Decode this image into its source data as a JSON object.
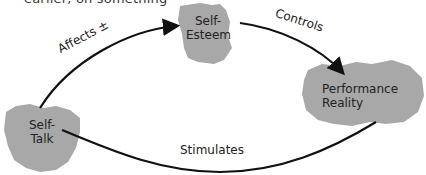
{
  "header": {
    "clipped_text": "earlier, on something"
  },
  "nodes": [
    {
      "id": "self-talk",
      "label_line1": "Self-",
      "label_line2": "Talk"
    },
    {
      "id": "self-esteem",
      "label_line1": "Self-",
      "label_line2": "Esteem"
    },
    {
      "id": "performance-reality",
      "label_line1": "Performance",
      "label_line2": "Reality"
    }
  ],
  "edges": [
    {
      "from": "self-talk",
      "to": "self-esteem",
      "label": "Affects ±"
    },
    {
      "from": "self-esteem",
      "to": "performance-reality",
      "label": "Controls"
    },
    {
      "from": "self-talk",
      "to": "performance-reality",
      "label": "Stimulates"
    }
  ],
  "colors": {
    "blob_fill": "#a8a8a8",
    "arrow": "#111111",
    "text": "#222222"
  }
}
